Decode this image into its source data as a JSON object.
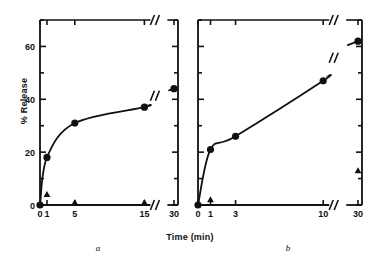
{
  "figure": {
    "xlabel": "Time (min)",
    "ylabel": "% Release",
    "panel_a_name": "a",
    "panel_b_name": "b",
    "ink": "#111111"
  },
  "chart_data": [
    {
      "type": "scatter",
      "panel": "a",
      "title": "",
      "xlabel": "Time (min)",
      "ylabel": "% Release",
      "xlim": [
        0,
        30
      ],
      "ylim": [
        0,
        70
      ],
      "grid": false,
      "legend": "none",
      "x_axis_break": true,
      "y_axis_break": false,
      "xticks": [
        0,
        1,
        5,
        15,
        30
      ],
      "xtick_labels": [
        "0",
        "1",
        "5",
        "15",
        "30"
      ],
      "yticks": [
        0,
        20,
        40,
        60
      ],
      "ytick_labels": [
        "0",
        "20",
        "40",
        "60"
      ],
      "yticks_minor": [
        10,
        30,
        50,
        70
      ],
      "series": [
        {
          "name": "release",
          "marker": "filled-circle",
          "x": [
            0,
            1,
            5,
            15,
            30
          ],
          "values": [
            0,
            18,
            31,
            37,
            44
          ]
        },
        {
          "name": "arrow-markers",
          "marker": "filled-triangle",
          "x": [
            1,
            5,
            15
          ],
          "values": [
            3,
            0,
            0
          ]
        }
      ],
      "curve_break_at_x": 22
    },
    {
      "type": "scatter",
      "panel": "b",
      "title": "",
      "xlabel": "Time (min)",
      "ylabel": "% Release",
      "xlim": [
        0,
        30
      ],
      "ylim": [
        0,
        70
      ],
      "grid": false,
      "legend": "none",
      "x_axis_break": true,
      "y_axis_break": false,
      "xticks": [
        0,
        1,
        3,
        10,
        30
      ],
      "xtick_labels": [
        "0",
        "1",
        "3",
        "10",
        "30"
      ],
      "yticks": [
        0,
        20,
        40,
        60
      ],
      "ytick_labels": [
        "0",
        "20",
        "40",
        "60"
      ],
      "yticks_minor": [
        10,
        30,
        50,
        70
      ],
      "series": [
        {
          "name": "release",
          "marker": "filled-circle",
          "x": [
            0,
            1,
            3,
            10,
            30
          ],
          "values": [
            0,
            21,
            26,
            47,
            62
          ]
        },
        {
          "name": "arrow-markers",
          "marker": "filled-triangle",
          "x": [
            1,
            30
          ],
          "values": [
            1,
            12
          ]
        }
      ],
      "curve_break_at_x": 22
    }
  ]
}
